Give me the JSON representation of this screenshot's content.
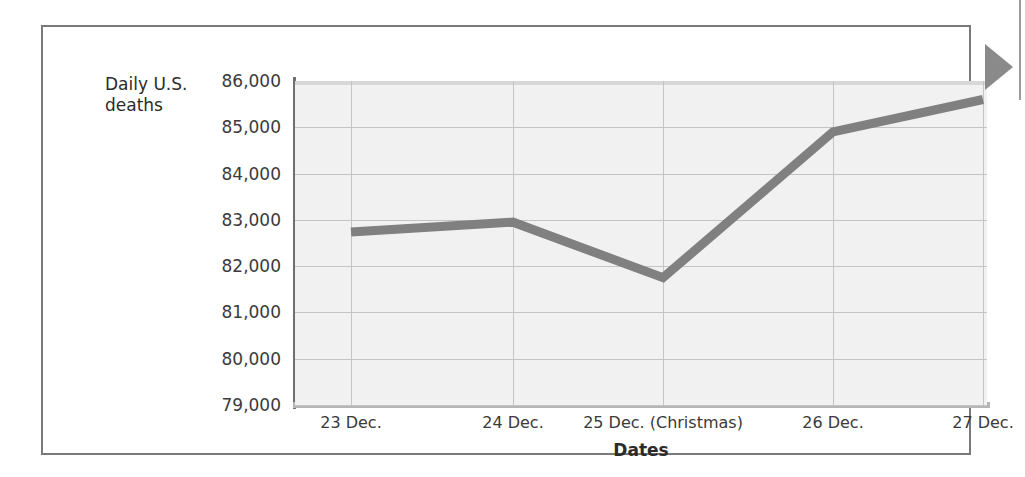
{
  "figure": {
    "y_axis_caption": "Daily U.S.\ndeaths",
    "y_axis_caption_line1": "Daily U.S.",
    "y_axis_caption_line2": "deaths",
    "x_axis_title": "Dates",
    "marker_icon": "right-triangle-marker",
    "colors": {
      "line": "#808080",
      "plot_background": "#f1f1f1",
      "gridline": "#c4c4c4",
      "axis": "#6f6f6f",
      "frame": "#7a7a7a",
      "text": "#2b2b2b",
      "marker": "#8a8a8a"
    }
  },
  "chart_data": {
    "type": "line",
    "title": "",
    "xlabel": "Dates",
    "ylabel": "Daily U.S. deaths",
    "categories": [
      "23 Dec.",
      "24 Dec.",
      "25 Dec. (Christmas)",
      "26 Dec.",
      "27 Dec."
    ],
    "values": [
      82740,
      82950,
      81750,
      84900,
      85600
    ],
    "ylim": [
      79000,
      86000
    ],
    "ytick_values": [
      79000,
      80000,
      81000,
      82000,
      83000,
      84000,
      85000,
      86000
    ],
    "ytick_labels": [
      "79,000",
      "80,000",
      "81,000",
      "82,000",
      "83,000",
      "84,000",
      "85,000",
      "86,000"
    ],
    "grid": true,
    "legend": "none",
    "series": [
      {
        "name": "Daily U.S. deaths",
        "values": [
          82740,
          82950,
          81750,
          84900,
          85600
        ]
      }
    ]
  }
}
